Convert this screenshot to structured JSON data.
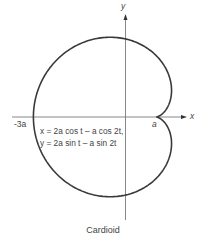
{
  "figure": {
    "caption": "Cardioid",
    "axes": {
      "x_label": "x",
      "y_label": "y",
      "tick_labels": {
        "left": "-3a",
        "right": "a"
      }
    },
    "equations": {
      "x_eq": "x = 2a cos t – a cos 2t,",
      "y_eq": "y = 2a sin t – a sin 2t"
    },
    "colors": {
      "curve": "#3a3a3a",
      "axis": "#6a6a6a",
      "text": "#444444"
    }
  },
  "chart_data": {
    "type": "line",
    "title": "Cardioid",
    "parametric": {
      "x": "2a cos t - a cos 2t",
      "y": "2a sin t - a sin 2t",
      "t_range": [
        0,
        6.2832
      ]
    },
    "a": 1,
    "xlabel": "x",
    "ylabel": "y",
    "x_ticks": [
      {
        "value": -3,
        "label": "-3a"
      },
      {
        "value": 1,
        "label": "a"
      }
    ],
    "xlim": [
      -3.7,
      2.0
    ],
    "ylim": [
      -3.3,
      3.4
    ],
    "grid": false,
    "legend": null
  }
}
